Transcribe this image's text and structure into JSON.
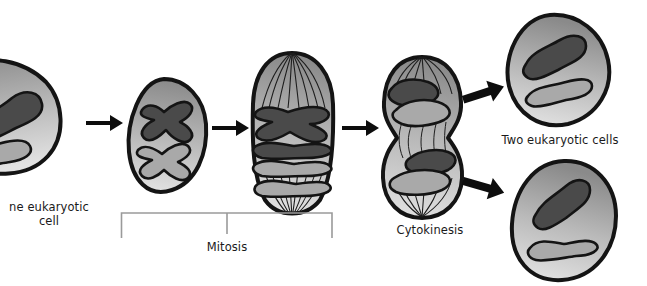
{
  "diagram": {
    "background_color": "#ffffff",
    "palette": {
      "cell_outline": "#141414",
      "cytoplasm_dark": "#8c8c8c",
      "cytoplasm_light": "#dcdcdc",
      "chromosome_dark": "#4a4a4a",
      "chromosome_light": "#a9a9a9",
      "spindle_fiber": "#1e1e1e",
      "arrow_color": "#0d0d0d",
      "bracket_color": "#9a9a9a",
      "text_color": "#1a1a1a"
    }
  },
  "labels": {
    "one_cell": "ne eukaryotic\ncell",
    "mitosis": "Mitosis",
    "cytokinesis": "Cytokinesis",
    "two_cells": "Two eukaryotic cells"
  },
  "stages": [
    {
      "id": "stage-interphase",
      "name": "one-eukaryotic-cell",
      "label": "ne eukaryotic\ncell",
      "chromosome_count": 2,
      "chromosome_shapes": [
        "rod-dark",
        "rod-light"
      ],
      "spindle_visible": false,
      "clipped_at_left_edge": true
    },
    {
      "id": "stage-prophase",
      "name": "duplicated-chromosomes-cell",
      "label": "",
      "chromosome_count": 2,
      "chromosome_shapes": [
        "x-shaped-dark",
        "x-shaped-light"
      ],
      "spindle_visible": false,
      "clipped_at_left_edge": false
    },
    {
      "id": "stage-metaphase-anaphase",
      "name": "mitosis-cell",
      "label": "",
      "chromosome_count": 4,
      "chromosome_shapes": [
        "x-shaped-dark",
        "rod-dark",
        "rod-light",
        "x-shaped-light"
      ],
      "spindle_visible": true,
      "clipped_at_left_edge": false
    },
    {
      "id": "stage-cytokinesis",
      "name": "cytokinesis-cell",
      "label": "Cytokinesis",
      "chromosome_count": 4,
      "chromosome_shapes": [
        "rod-dark",
        "rod-light",
        "rod-dark",
        "rod-light"
      ],
      "spindle_visible": true,
      "cleavage_furrow": true,
      "clipped_at_left_edge": false
    },
    {
      "id": "stage-daughter-top",
      "name": "daughter-cell-top",
      "label": "Two eukaryotic cells",
      "chromosome_count": 2,
      "chromosome_shapes": [
        "rod-dark",
        "rod-light"
      ],
      "spindle_visible": false,
      "clipped_at_left_edge": false
    },
    {
      "id": "stage-daughter-bottom",
      "name": "daughter-cell-bottom",
      "label": "",
      "chromosome_count": 2,
      "chromosome_shapes": [
        "rod-dark",
        "rod-light"
      ],
      "spindle_visible": false,
      "clipped_at_left_edge": false
    }
  ],
  "arrows": [
    {
      "name": "arrow-1",
      "direction": "right",
      "from": "stage-interphase",
      "to": "stage-prophase"
    },
    {
      "name": "arrow-2",
      "direction": "right",
      "from": "stage-prophase",
      "to": "stage-metaphase-anaphase"
    },
    {
      "name": "arrow-3",
      "direction": "right",
      "from": "stage-metaphase-anaphase",
      "to": "stage-cytokinesis"
    },
    {
      "name": "arrow-4",
      "direction": "up-right",
      "from": "stage-cytokinesis",
      "to": "stage-daughter-top"
    },
    {
      "name": "arrow-5",
      "direction": "down-right",
      "from": "stage-cytokinesis",
      "to": "stage-daughter-bottom"
    }
  ],
  "brackets": [
    {
      "name": "mitosis-bracket",
      "label": "Mitosis",
      "spans": [
        "stage-prophase",
        "stage-metaphase-anaphase"
      ]
    }
  ]
}
